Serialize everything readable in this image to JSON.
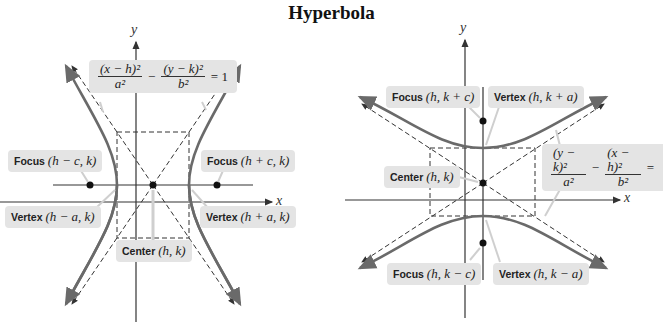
{
  "title": "Hyperbola",
  "left_graph": {
    "orientation": "horizontal transverse axis",
    "axis_x": "x",
    "axis_y": "y",
    "equation": {
      "term1_num": "(x − h)²",
      "term1_den": "a²",
      "operator": "−",
      "term2_num": "(y − k)²",
      "term2_den": "b²",
      "rhs": "= 1"
    },
    "labels": {
      "focus_left_word": "Focus",
      "focus_left_coord": "(h − c, k)",
      "focus_right_word": "Focus",
      "focus_right_coord": "(h + c, k)",
      "vertex_left_word": "Vertex",
      "vertex_left_coord": "(h − a, k)",
      "vertex_right_word": "Vertex",
      "vertex_right_coord": "(h + a, k)",
      "center_word": "Center",
      "center_coord": "(h, k)"
    }
  },
  "right_graph": {
    "orientation": "vertical transverse axis",
    "axis_x": "x",
    "axis_y": "y",
    "equation": {
      "term1_num": "(y − k)²",
      "term1_den": "a²",
      "operator": "−",
      "term2_num": "(x − h)²",
      "term2_den": "b²",
      "rhs": "="
    },
    "labels": {
      "focus_top_word": "Focus",
      "focus_top_coord": "(h, k + c)",
      "vertex_top_word": "Vertex",
      "vertex_top_coord": "(h, k + a)",
      "center_word": "Center",
      "center_coord": "(h, k)",
      "focus_bottom_word": "Focus",
      "focus_bottom_coord": "(h, k − c)",
      "vertex_bottom_word": "Vertex",
      "vertex_bottom_coord": "(h, k − a)"
    }
  },
  "colors": {
    "curve": "#6a6a6a",
    "axis": "#333333",
    "label_bg": "#e4e4e4"
  }
}
